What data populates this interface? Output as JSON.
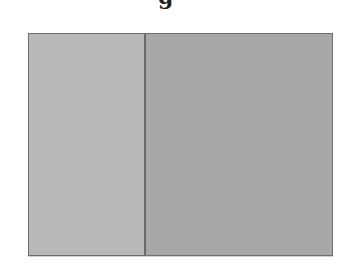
{
  "title": {
    "visible_fragment": "g"
  },
  "diagram": {
    "panels": [
      {
        "name": "left",
        "color": "#b9b9b9"
      },
      {
        "name": "right",
        "color": "#a8a8a8"
      }
    ],
    "border_color": "#6e6e6e",
    "divider_color": "#6a6a6a"
  }
}
